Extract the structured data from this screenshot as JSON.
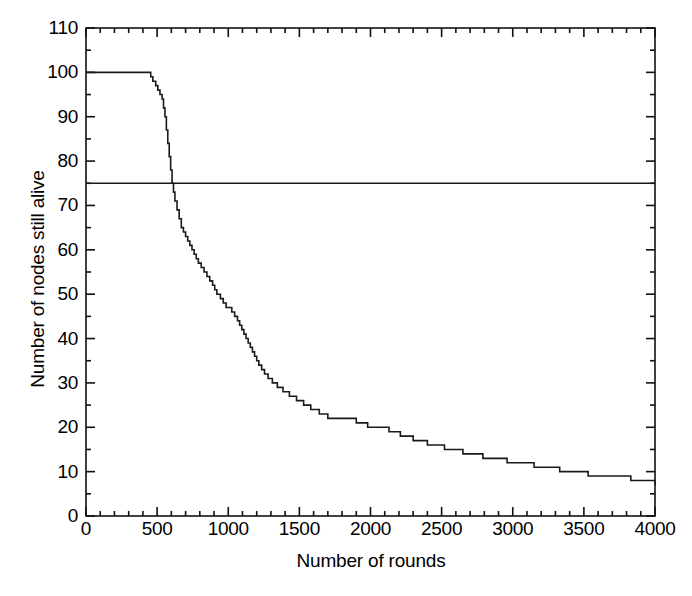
{
  "chart_data": {
    "type": "line",
    "title": "",
    "subtitle": "",
    "xlabel": "Number of rounds",
    "ylabel": "Number of nodes still alive",
    "xlim": [
      0,
      4000
    ],
    "ylim": [
      0,
      110
    ],
    "xticks": [
      0,
      500,
      1000,
      1500,
      2000,
      2500,
      3000,
      3500,
      4000
    ],
    "yticks": [
      0,
      10,
      20,
      30,
      40,
      50,
      60,
      70,
      80,
      90,
      100,
      110
    ],
    "xtick_labels": [
      "0",
      "500",
      "1000",
      "1500",
      "2000",
      "2500",
      "3000",
      "3500",
      "4000"
    ],
    "ytick_labels": [
      "0",
      "10",
      "20",
      "30",
      "40",
      "50",
      "60",
      "70",
      "80",
      "90",
      "100",
      "110"
    ],
    "x_minor_tick_interval": 100,
    "y_minor_tick_interval": 5,
    "grid": false,
    "legend": null,
    "line_color": "#1a1a1a",
    "line_width": 1.6,
    "series": [
      {
        "name": "nodes alive",
        "style": "step-post",
        "x": [
          0,
          430,
          455,
          470,
          490,
          505,
          520,
          535,
          545,
          555,
          565,
          575,
          585,
          595,
          605,
          615,
          625,
          640,
          655,
          670,
          685,
          700,
          715,
          730,
          745,
          760,
          775,
          790,
          810,
          830,
          850,
          870,
          890,
          905,
          920,
          945,
          965,
          985,
          1005,
          1025,
          1045,
          1065,
          1080,
          1095,
          1110,
          1125,
          1140,
          1155,
          1170,
          1185,
          1200,
          1215,
          1235,
          1255,
          1280,
          1310,
          1345,
          1385,
          1430,
          1480,
          1530,
          1580,
          1640,
          1700,
          1760,
          1830,
          1900,
          1980,
          2050,
          2130,
          2210,
          2300,
          2400,
          2520,
          2650,
          2790,
          2960,
          3150,
          3330,
          3530,
          3830,
          4000
        ],
        "y": [
          100,
          100,
          99,
          98,
          97,
          96,
          95,
          94,
          92,
          90,
          87,
          84,
          81,
          78,
          75,
          73,
          71,
          69,
          67,
          65,
          64,
          63,
          62,
          61,
          60,
          59,
          58,
          57,
          56,
          55,
          54,
          53,
          52,
          51,
          50,
          49,
          48,
          47,
          47,
          46,
          45,
          44,
          43,
          42,
          41,
          40,
          39,
          38,
          37,
          36,
          35,
          34,
          33,
          32,
          31,
          30,
          29,
          28,
          27,
          26,
          25,
          24,
          23,
          22,
          22,
          22,
          21,
          20,
          20,
          19,
          18,
          17,
          16,
          15,
          14,
          13,
          12,
          11,
          10,
          9,
          8,
          7
        ],
        "description": "Node survival staircase decaying from 100 alive nodes to 7 alive nodes over 4000 rounds"
      }
    ],
    "reference_lines": [
      {
        "name": "threshold-line",
        "orientation": "horizontal",
        "value": 75,
        "color": "#1a1a1a",
        "width": 1.6,
        "label": ""
      }
    ],
    "annotations": []
  },
  "axes": {
    "frame_color": "#111111",
    "frame_width": 1.6,
    "background": "#ffffff"
  }
}
